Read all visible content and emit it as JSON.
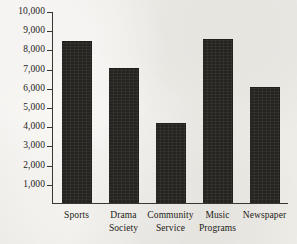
{
  "figure": {
    "background_color": "#eeece7",
    "bar_color": "#262420",
    "axis_color": "#3a372f",
    "text_color": "#1d1b17"
  },
  "chart_data": {
    "type": "bar",
    "title": "",
    "subtitle": "",
    "xlabel": "",
    "ylabel": "",
    "categories": [
      "Sports",
      "Drama Society",
      "Community Service",
      "Music Programs",
      "Newspaper"
    ],
    "category_lines": [
      [
        "Sports"
      ],
      [
        "Drama",
        "Society"
      ],
      [
        "Community",
        "Service"
      ],
      [
        "Music",
        "Programs"
      ],
      [
        "Newspaper"
      ]
    ],
    "values": [
      8500,
      7050,
      4200,
      8600,
      6100
    ],
    "ylim": [
      0,
      10000
    ],
    "ytick_values": [
      1000,
      2000,
      3000,
      4000,
      5000,
      6000,
      7000,
      8000,
      9000,
      10000
    ],
    "ytick_labels": [
      "1,000",
      "2,000",
      "3,000",
      "4,000",
      "5,000",
      "6,000",
      "7,000",
      "8,000",
      "9,000",
      "10,000"
    ],
    "grid": false,
    "legend": null,
    "annotations": []
  }
}
